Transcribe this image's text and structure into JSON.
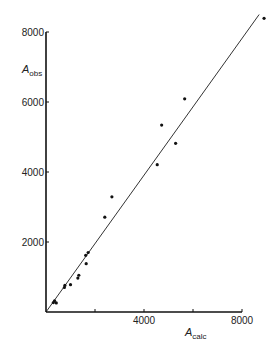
{
  "chart_data": {
    "type": "scatter",
    "title": "",
    "xlabel": "A_calc",
    "ylabel": "A_obs",
    "xlabel_main": "A",
    "xlabel_sub": "calc",
    "ylabel_main": "A",
    "ylabel_sub": "obs",
    "xlim": [
      0,
      8000
    ],
    "ylim": [
      0,
      8000
    ],
    "x_ticks": [
      0,
      2000,
      4000,
      6000,
      8000
    ],
    "x_tick_labels": [
      "",
      "",
      "4000",
      "",
      "8000"
    ],
    "y_ticks": [
      0,
      2000,
      4000,
      6000,
      8000
    ],
    "y_tick_labels": [
      "",
      "2000",
      "4000",
      "6000",
      "8000"
    ],
    "grid": false,
    "legend": null,
    "reference_line": {
      "type": "y=x",
      "from": [
        0,
        0
      ],
      "to": [
        8700,
        8500
      ]
    },
    "series": [
      {
        "name": "observed vs calculated",
        "points": [
          {
            "x": 300,
            "y": 270
          },
          {
            "x": 350,
            "y": 320
          },
          {
            "x": 420,
            "y": 260
          },
          {
            "x": 750,
            "y": 700
          },
          {
            "x": 770,
            "y": 760
          },
          {
            "x": 1000,
            "y": 780
          },
          {
            "x": 1300,
            "y": 970
          },
          {
            "x": 1340,
            "y": 1050
          },
          {
            "x": 1640,
            "y": 1380
          },
          {
            "x": 1620,
            "y": 1620
          },
          {
            "x": 1720,
            "y": 1700
          },
          {
            "x": 2400,
            "y": 2710
          },
          {
            "x": 2690,
            "y": 3290
          },
          {
            "x": 4540,
            "y": 4210
          },
          {
            "x": 5290,
            "y": 4820
          },
          {
            "x": 4720,
            "y": 5340
          },
          {
            "x": 5660,
            "y": 6090
          },
          {
            "x": 8900,
            "y": 8390
          }
        ]
      }
    ]
  },
  "colors": {
    "axis": "#111111",
    "points": "#111111",
    "line": "#333333",
    "background": "#ffffff"
  }
}
